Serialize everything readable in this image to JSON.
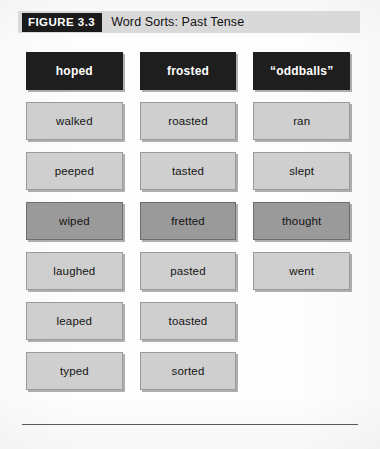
{
  "figure": {
    "badge": "FIGURE 3.3",
    "title": "Word Sorts: Past Tense"
  },
  "colors": {
    "header_strip": "#d9d9d9",
    "badge_background": "#1b1b1b",
    "column_header_background": "#1e1e1e",
    "cell_light": "#cfcfcf",
    "cell_dark": "#9a9a9a",
    "page_background": "#fdfdfd",
    "rule": "#5a5a5a"
  },
  "table": {
    "columns": [
      {
        "header": "hoped"
      },
      {
        "header": "frosted"
      },
      {
        "header": "“oddballs”"
      }
    ],
    "rows": [
      {
        "shade": "light",
        "cells": [
          "walked",
          "roasted",
          "ran"
        ]
      },
      {
        "shade": "light",
        "cells": [
          "peeped",
          "tasted",
          "slept"
        ]
      },
      {
        "shade": "dark",
        "cells": [
          "wiped",
          "fretted",
          "thought"
        ]
      },
      {
        "shade": "light",
        "cells": [
          "laughed",
          "pasted",
          "went"
        ]
      },
      {
        "shade": "light",
        "cells": [
          "leaped",
          "toasted",
          ""
        ]
      },
      {
        "shade": "light",
        "cells": [
          "typed",
          "sorted",
          ""
        ]
      }
    ]
  }
}
